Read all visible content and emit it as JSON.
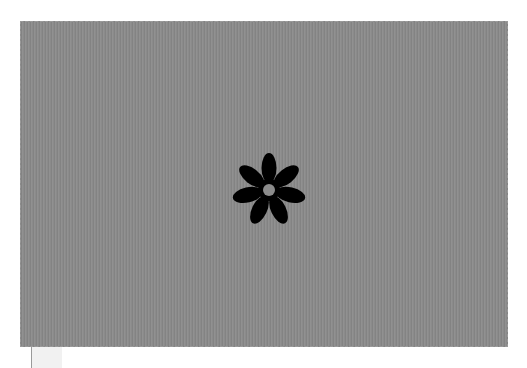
{
  "canvas": {
    "background_color": "#8b8b8b",
    "shape": {
      "icon": "seven-petal-flower-icon",
      "color": "#000000",
      "petal_count": 7,
      "center_hole_color": "#8b8b8b"
    }
  },
  "below_panel": {
    "color": "#f1f1f1"
  }
}
